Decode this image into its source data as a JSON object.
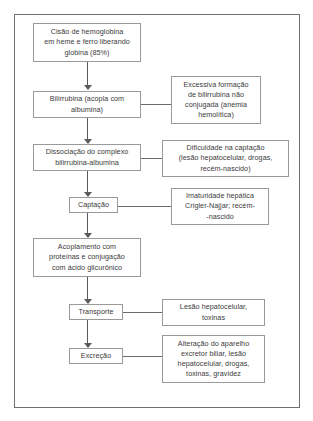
{
  "figure": {
    "frame_color": "#6f6f6f",
    "box_border_color": "#9a9a9a",
    "connector_color": "#5a5a5a",
    "text_color": "#3a3a3a",
    "background": "#ffffff"
  },
  "main_flow": [
    {
      "id": "cisao-hemoglobina",
      "label": "Cisão de hemoglobina\nem heme e ferro liberando\nglobina (85%)"
    },
    {
      "id": "bilirrubina-acopla",
      "label": "Bilirrubina (acopla com\nalbumina)"
    },
    {
      "id": "dissociacao-complexo",
      "label": "Dissociação do complexo\nbilirrubina-albumina"
    },
    {
      "id": "captacao",
      "label": "Captação"
    },
    {
      "id": "acoplamento-proteinas",
      "label": "Acoplamento com\nproteínas e conjugação\ncom ácido glicurônico"
    },
    {
      "id": "transporte",
      "label": "Transporte"
    },
    {
      "id": "excrecao",
      "label": "Excreção"
    }
  ],
  "side_notes": [
    {
      "id": "excessiva-formacao",
      "label": "Excessiva formação\nde bilirrubina não\nconjugada (anemia\nhemolítica)",
      "attached_to": "bilirrubina-acopla"
    },
    {
      "id": "dificuldade-captacao",
      "label": "Dificuldade na captação\n(lesão hepatocelular, drogas,\nrecém-nascido)",
      "attached_to": "dissociacao-complexo"
    },
    {
      "id": "imaturidade-hepatica",
      "label": "Imaturidade hepática\nCrigler-Najjar; recém-\n-nascido",
      "attached_to": "captacao"
    },
    {
      "id": "lesao-hepatocelular-toxinas",
      "label": "Lesão hepatocelular,\ntoxinas",
      "attached_to": "transporte"
    },
    {
      "id": "alteracao-aparelho-excretor",
      "label": "Alteração do aparelho\nexcretor biliar, lesão\nhepatocelular, drogas,\ntoxinas, gravidez",
      "attached_to": "excrecao"
    }
  ]
}
